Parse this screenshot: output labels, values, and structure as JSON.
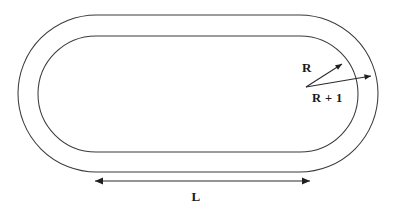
{
  "figure": {
    "kind": "geometry-diagram",
    "background_color": "#ffffff",
    "stroke_color": "#3b3b3b",
    "label_color": "#1a1a1a"
  },
  "labels": {
    "inner_radius": "R",
    "outer_radius": "R + 1",
    "straight_length": "L"
  },
  "geometry": {
    "outer_track": {
      "name": "outer-boundary",
      "left_x": 18,
      "right_x": 378,
      "top_y": 15,
      "bottom_y": 172,
      "corner_radius": 78.5
    },
    "inner_track": {
      "name": "inner-boundary",
      "left_x": 38,
      "right_x": 358,
      "top_y": 36,
      "bottom_y": 152,
      "corner_radius": 58
    },
    "radius_origin": {
      "x": 306,
      "y": 87
    },
    "inner_radius_arrow_tip": {
      "x": 342,
      "y": 64
    },
    "outer_radius_arrow_tip": {
      "x": 371,
      "y": 76
    },
    "length_dimension": {
      "left_x": 95,
      "right_x": 310,
      "y": 181
    }
  },
  "label_positions": {
    "inner_radius": {
      "x": 307,
      "y": 72
    },
    "outer_radius": {
      "x": 312,
      "y": 102
    },
    "straight_length": {
      "x": 196,
      "y": 201
    }
  }
}
